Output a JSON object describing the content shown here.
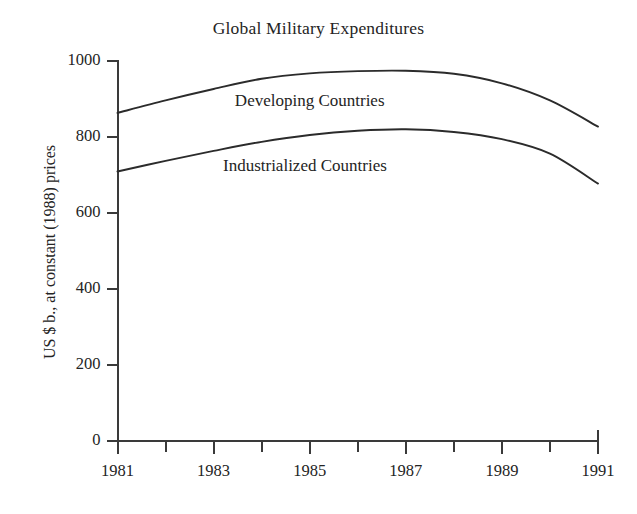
{
  "chart_data": {
    "type": "line",
    "title": "Global Military Expenditures",
    "xlabel": "",
    "ylabel": "US $ b., at constant (1988) prices",
    "xlim": [
      1981,
      1991
    ],
    "ylim": [
      0,
      1000
    ],
    "grid": false,
    "legend_position": "inline-labels",
    "x": [
      1981,
      1982,
      1983,
      1984,
      1985,
      1986,
      1987,
      1988,
      1989,
      1990,
      1991
    ],
    "x_tick_labels": [
      "1981",
      "1983",
      "1985",
      "1987",
      "1989",
      "1991"
    ],
    "x_tick_values": [
      1981,
      1983,
      1985,
      1987,
      1989,
      1991
    ],
    "x_minor_tick_values": [
      1982,
      1984,
      1986,
      1988,
      1990
    ],
    "y_tick_labels": [
      "0",
      "200",
      "400",
      "600",
      "800",
      "1000"
    ],
    "y_tick_values": [
      0,
      200,
      400,
      600,
      800,
      1000
    ],
    "series": [
      {
        "name": "Developing Countries",
        "values": [
          862,
          895,
          925,
          952,
          966,
          972,
          973,
          965,
          940,
          895,
          826
        ],
        "color": "#2b2b2b"
      },
      {
        "name": "Industrialized Countries",
        "values": [
          708,
          736,
          762,
          786,
          804,
          815,
          819,
          812,
          793,
          755,
          676
        ],
        "color": "#2b2b2b"
      }
    ],
    "annotations": [
      {
        "text": "Developing Countries",
        "x": 1985.0,
        "y": 890
      },
      {
        "text": "Industrialized Countries",
        "x": 1984.9,
        "y": 720
      }
    ]
  },
  "colors": {
    "axis": "#3a3a3a",
    "line": "#2b2b2b",
    "text": "#242424",
    "background": "#ffffff"
  }
}
